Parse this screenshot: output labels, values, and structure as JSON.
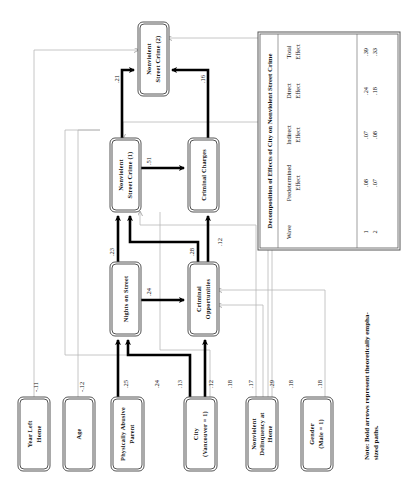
{
  "diagram": {
    "orientation": "rotated-90-ccw",
    "nodes": {
      "year_left_home": {
        "l1": "Year Left",
        "l2": "Home"
      },
      "age": {
        "l1": "Age"
      },
      "abusive_parent": {
        "l1": "Physically Abusive",
        "l2": "Parent"
      },
      "city": {
        "l1": "City",
        "l2": "(Vancouver = 1)"
      },
      "delinquency": {
        "l1": "Nonviolent",
        "l2": "Delinquency at",
        "l3": "Home"
      },
      "gender": {
        "l1": "Gender",
        "l2": "(Male = 1)"
      },
      "nights_on_street": {
        "l1": "Nights on Street"
      },
      "criminal_opportunities": {
        "l1": "Criminal",
        "l2": "Opportunities"
      },
      "nsc1": {
        "l1": "Nonviolent",
        "l2": "Street Crime (1)"
      },
      "criminal_charges": {
        "l1": "Criminal Charges"
      },
      "nsc2": {
        "l1": "Nonviolent",
        "l2": "Street Crime (2)"
      }
    },
    "coefficients": {
      "year_left_home": "-.11",
      "age": "-.12",
      "abusive_nights": ".25",
      "city_nights": ".24",
      "city_opps": ".13",
      "city_opps2": ".12",
      "city_thin": ".18",
      "delinq_1": ".17",
      "delinq_2": ".29",
      "delinq_3": ".18",
      "gender": ".18",
      "nights_nsc1": ".23",
      "nights_opps": ".24",
      "opps_nsc1": ".28",
      "opps_charges": ".12",
      "nsc1_charges": ".51",
      "nsc1_nsc2": ".21",
      "charges_nsc2": ".16"
    },
    "note": {
      "l1": "Note: Bold arrows represent theoretically empha-",
      "l2": "sized paths."
    }
  },
  "table": {
    "title": "Decomposition of Effects of City on Nonviolent Street Crime",
    "headers": [
      {
        "l1": "Wave",
        "l2": ""
      },
      {
        "l1": "Predetermined",
        "l2": "Effect"
      },
      {
        "l1": "Indirect",
        "l2": "Effect"
      },
      {
        "l1": "Direct",
        "l2": "Effect"
      },
      {
        "l1": "Total",
        "l2": "Effect"
      }
    ],
    "rows": [
      [
        "1",
        ".08",
        ".07",
        ".24",
        ".39"
      ],
      [
        "2",
        ".07",
        ".08",
        ".18",
        ".33"
      ]
    ]
  }
}
